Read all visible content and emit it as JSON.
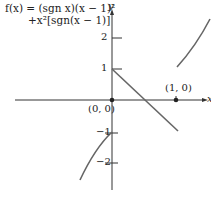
{
  "formula": {
    "line1": "f(x) = (sgn x)(x − 1)²",
    "line2": "+x²[sgn(x − 1)]"
  },
  "axes": {
    "x_label": "x",
    "y_label": "y",
    "y_ticks": [
      {
        "label": "2",
        "value": 2
      },
      {
        "label": "1",
        "value": 1
      },
      {
        "label": "−1",
        "value": -1
      },
      {
        "label": "−2",
        "value": -2
      }
    ]
  },
  "points": [
    {
      "label": "(0, 0)",
      "x": 0,
      "y": 0
    },
    {
      "label": "(1, 0)",
      "x": 1,
      "y": 0
    }
  ],
  "colors": {
    "axis": "#333333",
    "curve": "#666666",
    "text": "#222222"
  }
}
